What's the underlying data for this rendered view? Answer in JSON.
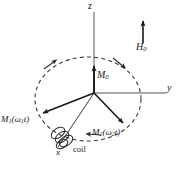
{
  "figure": {
    "background_color": "#ffffff",
    "axis_color": "#8c8c8c",
    "vector_color": "#1a1a1a",
    "dashed_color": "#3a3a3a",
    "label_color": "#1a1a1a"
  },
  "axes": {
    "z": {
      "label": "z",
      "x": 94,
      "y_top": 12,
      "y_bottom": 93
    },
    "y": {
      "label": "y",
      "x_start": 94,
      "x_end": 165,
      "y": 93
    },
    "x": {
      "label": "x",
      "x_start": 94,
      "x_end": 62,
      "y_start": 93,
      "y_end": 141
    }
  },
  "origin": {
    "x": 94,
    "y": 93
  },
  "vectors": [
    {
      "name": "M0",
      "label_main": "M",
      "label_sub": "0",
      "label_suffix": "",
      "tip_x": 94,
      "tip_y": 63,
      "description": "static magnetization along z"
    },
    {
      "name": "M1",
      "label_main": "M",
      "label_sub": "1",
      "label_suffix": "(ω",
      "label_sub2": "1",
      "label_tail": "t)",
      "tip_x": 40,
      "tip_y": 115,
      "description": "rotating magnetization component one"
    },
    {
      "name": "M2",
      "label_main": "M",
      "label_sub": "2",
      "label_suffix": "(ω",
      "label_sub2": "2",
      "label_tail": "t)",
      "tip_x": 126,
      "tip_y": 126,
      "description": "rotating magnetization component two"
    }
  ],
  "field": {
    "label_main": "H",
    "label_sub": "0",
    "arrow_x": 143,
    "arrow_y_top": 20,
    "arrow_y_bottom": 43,
    "description": "external static magnetic field, pointing up"
  },
  "precession_orbit": {
    "type": "dashed-ellipse",
    "center_x": 88,
    "center_y": 99,
    "radius_x": 53,
    "radius_y": 42,
    "dash_pattern": "4 3",
    "arrow_count": 3,
    "sense": "clockwise-viewed-from-above"
  },
  "coil": {
    "label": "coil",
    "center_x": 62,
    "center_y": 140,
    "loops": 4,
    "description": "pickup coil wound on the x axis"
  },
  "labels": {
    "z": "z",
    "y": "y",
    "x": "x",
    "coil": "coil"
  }
}
